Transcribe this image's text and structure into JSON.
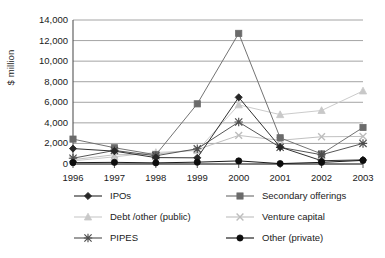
{
  "chart_data": {
    "type": "line",
    "title": "",
    "xlabel": "",
    "ylabel": "$ million",
    "categories": [
      "1996",
      "1997",
      "1998",
      "1999",
      "2000",
      "2001",
      "2002",
      "2003"
    ],
    "ylim": [
      0,
      14000
    ],
    "ytick_values": [
      0,
      2000,
      4000,
      6000,
      8000,
      10000,
      12000,
      14000
    ],
    "ytick_labels": [
      "0",
      "2,000",
      "4,000",
      "6,000",
      "8,000",
      "10,000",
      "12,000",
      "14,000"
    ],
    "grid": "horizontal",
    "legend_position": "bottom",
    "series": [
      {
        "name": "IPOs",
        "marker": "diamond",
        "color": "#262626",
        "values": [
          1500,
          1250,
          620,
          600,
          6480,
          1650,
          320,
          400
        ]
      },
      {
        "name": "Secondary offerings",
        "marker": "square",
        "color": "#6b6b6b",
        "values": [
          2420,
          1580,
          900,
          5850,
          12700,
          2550,
          980,
          3550
        ]
      },
      {
        "name": "Debt /other (public)",
        "marker": "triangle",
        "color": "#c8c8c8",
        "values": [
          300,
          700,
          1120,
          1300,
          5750,
          4800,
          5200,
          7100
        ]
      },
      {
        "name": "Venture capital",
        "marker": "x",
        "color": "#bdbdbd",
        "values": [
          420,
          900,
          960,
          1400,
          2780,
          2300,
          2650,
          2680
        ]
      },
      {
        "name": "PIPES",
        "marker": "asterisk",
        "color": "#4d4d4d",
        "values": [
          560,
          1320,
          800,
          1480,
          4080,
          1620,
          900,
          2000
        ]
      },
      {
        "name": "Other (private)",
        "marker": "circle",
        "color": "#0d0d0d",
        "values": [
          130,
          160,
          110,
          180,
          300,
          40,
          160,
          350
        ]
      }
    ]
  },
  "axis": {
    "y_title": "$ million"
  }
}
